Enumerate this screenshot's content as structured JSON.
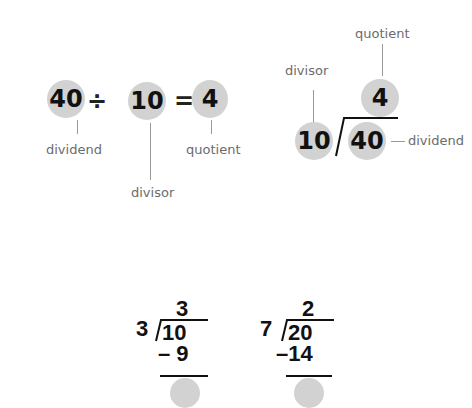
{
  "equation": {
    "dividend": "40",
    "divide_sign": "÷",
    "divisor": "10",
    "equals_sign": "=",
    "quotient": "4",
    "labels": {
      "dividend": "dividend",
      "divisor": "divisor",
      "quotient": "quotient"
    }
  },
  "long_division_labeled": {
    "divisor": "10",
    "dividend": "40",
    "quotient": "4",
    "labels": {
      "divisor": "divisor",
      "dividend": "dividend",
      "quotient": "quotient"
    }
  },
  "examples": [
    {
      "divisor": "3",
      "dividend": "10",
      "quotient": "3",
      "subtract": "– 9"
    },
    {
      "divisor": "7",
      "dividend": "20",
      "quotient": "2",
      "subtract": "–14"
    }
  ],
  "colors": {
    "circle": "#d2d2d2",
    "label": "#6b6b6b",
    "line": "#9a9a9a",
    "text": "#111111"
  }
}
